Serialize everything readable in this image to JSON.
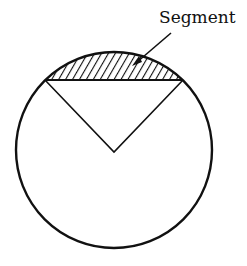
{
  "diagram": {
    "label": "Segment",
    "colors": {
      "stroke": "#111111",
      "background": "#ffffff",
      "hatch": "#111111"
    },
    "circle": {
      "cx": 114,
      "cy": 150,
      "r": 98
    },
    "chord": {
      "x1": 45,
      "y1": 80,
      "x2": 183,
      "y2": 80
    },
    "center_point": {
      "x": 114,
      "y": 152
    }
  }
}
